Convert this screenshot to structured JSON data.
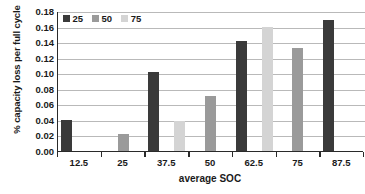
{
  "chart_data": {
    "type": "bar",
    "title": "",
    "xlabel": "average SOC",
    "ylabel": "% capacity loss  per full cycle",
    "categories": [
      "12.5",
      "25",
      "37.5",
      "50",
      "62.5",
      "75",
      "87.5"
    ],
    "series": [
      {
        "name": "25",
        "color": "#3a3a3a",
        "values": [
          0.04,
          null,
          0.101,
          null,
          0.142,
          null,
          0.168
        ]
      },
      {
        "name": "50",
        "color": "#9a9a9a",
        "values": [
          null,
          0.022,
          null,
          0.071,
          null,
          0.132,
          null
        ]
      },
      {
        "name": "75",
        "color": "#d4d4d4",
        "values": [
          null,
          null,
          0.038,
          null,
          0.16,
          null,
          null
        ]
      }
    ],
    "ylim": [
      0.0,
      0.18
    ],
    "ytick_step": 0.02,
    "yticks": [
      "0.00",
      "0.02",
      "0.04",
      "0.06",
      "0.08",
      "0.10",
      "0.12",
      "0.14",
      "0.16",
      "0.18"
    ],
    "grid": "horizontal",
    "legend_position": "top-left",
    "legend": [
      {
        "label": "25",
        "color": "#3a3a3a"
      },
      {
        "label": "50",
        "color": "#9a9a9a"
      },
      {
        "label": "75",
        "color": "#d4d4d4"
      }
    ],
    "axis_color": "#2a2a2a",
    "gridline_color": "#b9b9b9",
    "background": "#ffffff"
  }
}
